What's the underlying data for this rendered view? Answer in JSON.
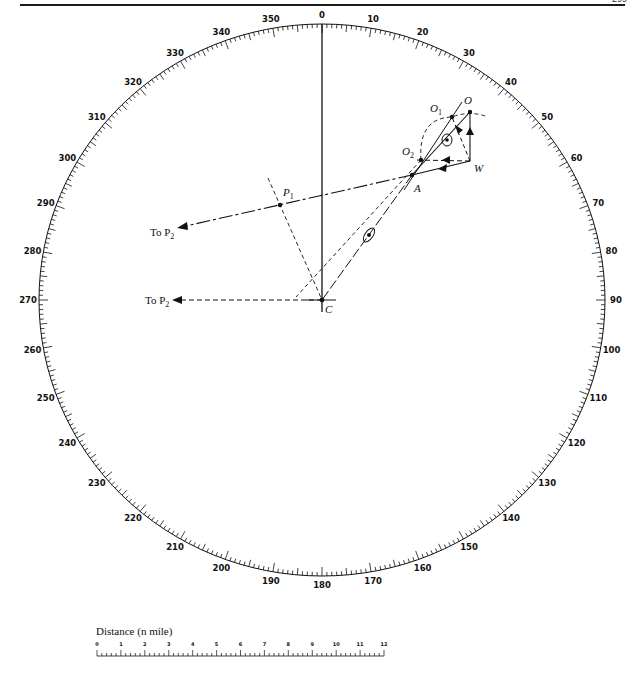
{
  "page": {
    "page_number": "299"
  },
  "compass": {
    "center": [
      322,
      300
    ],
    "rx": 283,
    "ry": 276,
    "labels": [
      "0",
      "10",
      "20",
      "30",
      "40",
      "50",
      "60",
      "70",
      "80",
      "90",
      "100",
      "110",
      "120",
      "130",
      "140",
      "150",
      "160",
      "170",
      "180",
      "190",
      "200",
      "210",
      "220",
      "230",
      "240",
      "250",
      "260",
      "270",
      "280",
      "290",
      "300",
      "310",
      "320",
      "330",
      "340",
      "350"
    ]
  },
  "points": {
    "O": {
      "label": "O",
      "x": 470,
      "y": 112
    },
    "O1": {
      "label": "O",
      "sub": "1",
      "x": 452,
      "y": 117
    },
    "O2": {
      "label": "O",
      "sub": "2",
      "x": 421,
      "y": 160
    },
    "W": {
      "label": "W",
      "x": 470,
      "y": 161
    },
    "A": {
      "label": "A",
      "x": 412,
      "y": 175
    },
    "P1": {
      "label": "P",
      "sub": "1",
      "x": 280,
      "y": 205
    },
    "C": {
      "label": "C",
      "x": 322,
      "y": 300
    }
  },
  "annotations": {
    "to_p2_upper": {
      "text": "To P",
      "sub": "2"
    },
    "to_p2_lower": {
      "text": "To P",
      "sub": "2"
    }
  },
  "scale_bar": {
    "title": "Distance (n mile)",
    "ticks": [
      "0",
      "1",
      "2",
      "3",
      "4",
      "5",
      "6",
      "7",
      "8",
      "9",
      "10",
      "11",
      "12"
    ]
  }
}
